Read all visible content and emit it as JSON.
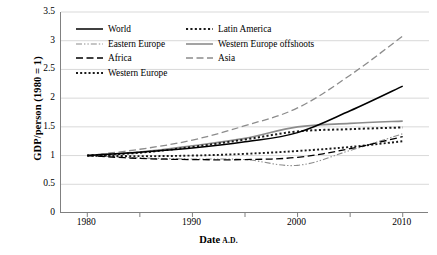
{
  "chart_data": {
    "type": "line",
    "title": "",
    "xlabel": "Date A.D.",
    "ylabel": "GDP/person (1980 = 1)",
    "xlabel_main": "Date",
    "xlabel_suffix": "A.D.",
    "xlim": [
      1977.5,
      2012.5
    ],
    "ylim": [
      0,
      3.5
    ],
    "yticks": [
      3.5,
      3,
      2.5,
      2,
      1.5,
      1,
      0.5,
      0
    ],
    "ytick_labels": [
      "3.5",
      "3",
      "2.5",
      "2",
      "1.5",
      "1",
      "0.5",
      "0"
    ],
    "xticks": [
      1980,
      1990,
      2000,
      2010
    ],
    "xtick_labels": [
      "1980",
      "1990",
      "2000",
      "2010"
    ],
    "xminor_ticks": [
      1985,
      1995,
      2005
    ],
    "grid": "horizontal",
    "legend_position": "upper-left-inside",
    "x": [
      1980,
      1985,
      1990,
      1995,
      2000,
      2005,
      2010
    ],
    "series": [
      {
        "name": "World",
        "style": "solid",
        "color": "#000000",
        "width": 1.5,
        "values": [
          1.0,
          1.06,
          1.13,
          1.24,
          1.4,
          1.78,
          2.21
        ]
      },
      {
        "name": "Latin America",
        "style": "dotted-square",
        "color": "#1a1a1a",
        "width": 2.0,
        "values": [
          1.0,
          1.05,
          1.15,
          1.28,
          1.42,
          1.46,
          1.49
        ]
      },
      {
        "name": "Eastern Europe",
        "style": "dash-dot-dot",
        "color": "#8c8c8c",
        "width": 1.1,
        "values": [
          1.0,
          0.96,
          0.94,
          0.93,
          0.83,
          1.09,
          1.38
        ]
      },
      {
        "name": "Western Europe offshoots",
        "style": "solid",
        "color": "#8c8c8c",
        "width": 1.6,
        "values": [
          1.0,
          1.06,
          1.17,
          1.3,
          1.5,
          1.56,
          1.6
        ]
      },
      {
        "name": "Africa",
        "style": "long-dash",
        "color": "#000000",
        "width": 1.3,
        "values": [
          1.0,
          0.95,
          0.93,
          0.93,
          0.97,
          1.12,
          1.33
        ]
      },
      {
        "name": "Asia",
        "style": "long-dash",
        "color": "#8c8c8c",
        "width": 1.3,
        "values": [
          1.0,
          1.11,
          1.27,
          1.52,
          1.83,
          2.4,
          3.08
        ]
      },
      {
        "name": "Western Europe",
        "style": "dotted-square",
        "color": "#1a1a1a",
        "width": 1.9,
        "values": [
          1.0,
          0.99,
          1.0,
          1.03,
          1.08,
          1.15,
          1.25
        ]
      }
    ]
  },
  "legend": {
    "rows": [
      [
        {
          "label": "World",
          "series": 0
        },
        {
          "label": "Latin America",
          "series": 1
        }
      ],
      [
        {
          "label": "Eastern Europe",
          "series": 2
        },
        {
          "label": "Western Europe offshoots",
          "series": 3
        }
      ],
      [
        {
          "label": "Africa",
          "series": 4
        },
        {
          "label": "Asia",
          "series": 5
        }
      ],
      [
        {
          "label": "Western Europe",
          "series": 6
        }
      ]
    ]
  },
  "colors": {
    "axis": "#808080",
    "grid": "#d9d9d9",
    "black": "#000000",
    "gray": "#8c8c8c",
    "background": "#ffffff"
  }
}
